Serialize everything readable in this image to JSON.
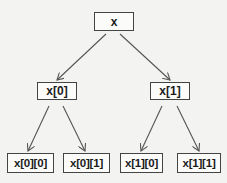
{
  "diagram": {
    "type": "tree",
    "colors": {
      "background": "#f3f3f1",
      "node_fill": "#fbfbfa",
      "node_border": "#444444",
      "edge": "#555555",
      "text": "#1c1c1c"
    },
    "nodes": {
      "root": {
        "id": "x",
        "label": "x"
      },
      "level1": [
        {
          "id": "x0",
          "label": "x[0]"
        },
        {
          "id": "x1",
          "label": "x[1]"
        }
      ],
      "level2": [
        {
          "id": "x00",
          "label": "x[0][0]"
        },
        {
          "id": "x01",
          "label": "x[0][1]"
        },
        {
          "id": "x10",
          "label": "x[1][0]"
        },
        {
          "id": "x11",
          "label": "x[1][1]"
        }
      ]
    },
    "edges": [
      {
        "from": "x",
        "to": "x0"
      },
      {
        "from": "x",
        "to": "x1"
      },
      {
        "from": "x0",
        "to": "x00"
      },
      {
        "from": "x0",
        "to": "x01"
      },
      {
        "from": "x1",
        "to": "x10"
      },
      {
        "from": "x1",
        "to": "x11"
      }
    ]
  }
}
